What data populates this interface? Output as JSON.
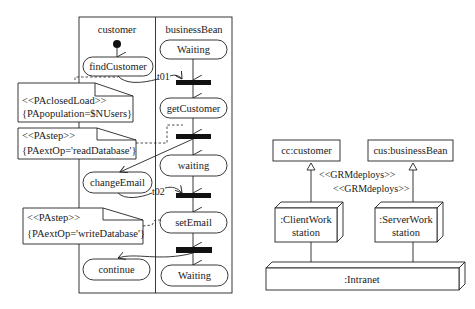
{
  "activity": {
    "lanes": [
      {
        "label": "customer"
      },
      {
        "label": "businessBean"
      }
    ],
    "customer_states": {
      "find": "findCustomer",
      "change": "changeEmail",
      "cont": "continue"
    },
    "bean_states": {
      "waiting1": "Waiting",
      "get": "getCustomer",
      "waiting2": "waiting",
      "set": "setEmail",
      "waiting3": "Waiting"
    },
    "transitions": {
      "t1": "t01",
      "t2": "t02"
    },
    "notes": [
      {
        "line1": "<<PAclosedLoad>>",
        "line2": "{PApopulation=$NUsers}"
      },
      {
        "line1": "<<PAstep>>",
        "line2": "{PAextOp='readDatabase'}"
      },
      {
        "line1": "<<PAstep>>",
        "line2": "{PAextOp='writeDatabase'}"
      }
    ]
  },
  "deployment": {
    "components": [
      {
        "label": "cc:customer"
      },
      {
        "label": "cus:businessBean"
      }
    ],
    "deploy_labels": [
      "<<GRMdeploys>>",
      "<<GRMdeploys>>"
    ],
    "nodes": [
      {
        "line1": ":ClientWork",
        "line2": "station"
      },
      {
        "line1": ":ServerWork",
        "line2": "station"
      }
    ],
    "network": ":Intranet"
  }
}
